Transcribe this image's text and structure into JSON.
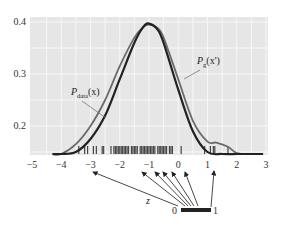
{
  "chart_data": {
    "type": "line",
    "title": "",
    "xlabel": "",
    "ylabel": "",
    "xlim": [
      -5,
      3
    ],
    "ylim": [
      0.14,
      0.41
    ],
    "grid": true,
    "x_ticks": [
      "-5",
      "-4",
      "-3",
      "-2",
      "-1",
      "0",
      "1",
      "2",
      "3"
    ],
    "y_ticks": [
      "0.4",
      "0.3",
      "0.2"
    ],
    "series": [
      {
        "name": "P_data(x)",
        "label_main": "P",
        "label_sub": "data",
        "label_arg": "(x)",
        "color": "#222222",
        "x": [
          -4.3,
          -4.0,
          -3.5,
          -3.0,
          -2.5,
          -2.0,
          -1.5,
          -1.2,
          -1.0,
          -0.7,
          -0.5,
          0.0,
          0.5,
          1.0,
          1.5,
          2.0,
          2.5,
          2.9
        ],
        "values": [
          0.14,
          0.142,
          0.15,
          0.175,
          0.22,
          0.29,
          0.36,
          0.39,
          0.397,
          0.385,
          0.36,
          0.27,
          0.19,
          0.15,
          0.143,
          0.141,
          0.14,
          0.14
        ]
      },
      {
        "name": "P_g(x')",
        "label_main": "P",
        "label_sub": "g",
        "label_arg": "(x')",
        "color": "#6b6b6b",
        "x": [
          -4.3,
          -4.0,
          -3.5,
          -3.0,
          -2.5,
          -2.0,
          -1.5,
          -1.2,
          -1.0,
          -0.7,
          -0.5,
          0.0,
          0.5,
          1.0,
          1.3,
          1.7,
          2.0,
          2.5,
          2.9
        ],
        "values": [
          0.14,
          0.145,
          0.165,
          0.2,
          0.25,
          0.315,
          0.37,
          0.39,
          0.395,
          0.388,
          0.37,
          0.29,
          0.21,
          0.17,
          0.168,
          0.16,
          0.148,
          0.141,
          0.14
        ]
      }
    ],
    "rug_samples": [
      -3.4,
      -3.2,
      -3.1,
      -2.9,
      -2.8,
      -2.6,
      -2.55,
      -2.3,
      -2.2,
      -2.15,
      -2.1,
      -2.05,
      -2.0,
      -1.95,
      -1.9,
      -1.85,
      -1.8,
      -1.75,
      -1.7,
      -1.6,
      -1.55,
      -1.5,
      -1.45,
      -1.4,
      -1.3,
      -1.25,
      -1.2,
      -1.15,
      -1.1,
      -1.05,
      -1.0,
      -0.95,
      -0.9,
      -0.85,
      -0.8,
      -0.7,
      -0.65,
      -0.6,
      -0.55,
      -0.5,
      -0.45,
      -0.4,
      -0.3,
      -0.25,
      -0.2,
      0.1,
      0.9,
      1.1,
      1.2,
      1.25,
      1.7
    ],
    "annotations": [
      {
        "text": "z",
        "role": "latent variable label"
      },
      {
        "text": "0",
        "role": "uniform range start"
      },
      {
        "text": "1",
        "role": "uniform range end"
      }
    ]
  },
  "labels": {
    "z": "z",
    "range_start": "0",
    "range_end": "1"
  }
}
